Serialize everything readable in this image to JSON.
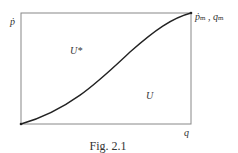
{
  "figure": {
    "caption": "Fig. 2.1",
    "y_axis_label": "ṗ",
    "x_axis_label": "q",
    "corner_label_main_p": "ṗ",
    "corner_label_sub_m1": "m",
    "corner_label_sep": " , ",
    "corner_label_main_q": "q",
    "corner_label_sub_m2": "m",
    "region_upper": "U*",
    "region_lower": "U"
  }
}
